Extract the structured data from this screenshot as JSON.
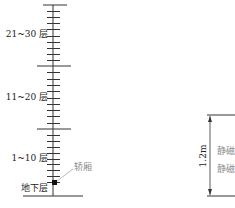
{
  "diagram": {
    "colors": {
      "line": "#333333",
      "text": "#222222",
      "muted": "#8a8a8a",
      "car": "#111111"
    },
    "shaft": {
      "segments": [
        {
          "label": "21~30 层",
          "top": 5,
          "bottom": 66
        },
        {
          "label": "11~20 层",
          "top": 66,
          "bottom": 129
        },
        {
          "label": "1~10 层",
          "top": 129,
          "bottom": 188
        }
      ],
      "basement_label": "地下层",
      "car_label": "轿厢"
    },
    "dimension": {
      "value": "1.2m",
      "labels": [
        "静磁",
        "静磁I"
      ]
    }
  }
}
